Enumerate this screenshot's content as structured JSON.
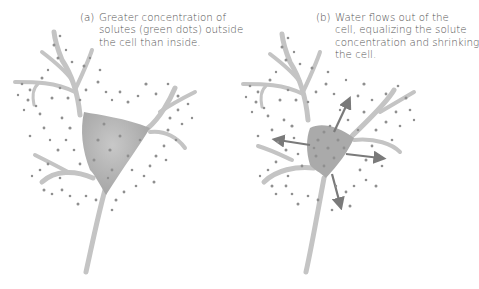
{
  "panels": [
    {
      "id": "a",
      "label": "(a)",
      "caption_lines": [
        "Greater concentration of",
        "solutes (green dots) outside",
        "the cell than inside."
      ],
      "cell_state": "normal"
    },
    {
      "id": "b",
      "label": "(b)",
      "caption_lines": [
        "Water flows out of the",
        "cell, equalizing the solute",
        "concentration and shrinking",
        "the cell."
      ],
      "cell_state": "shrunken",
      "arrows": [
        "up",
        "left",
        "right",
        "down"
      ]
    }
  ],
  "colors": {
    "cell_fill": "#b9b9b9",
    "cell_body": "#a8a8a8",
    "dendrite": "#c4c4c4",
    "solute_dot": "#8f8f8f",
    "arrow": "#7a7a7a",
    "caption_text": "#555555"
  }
}
